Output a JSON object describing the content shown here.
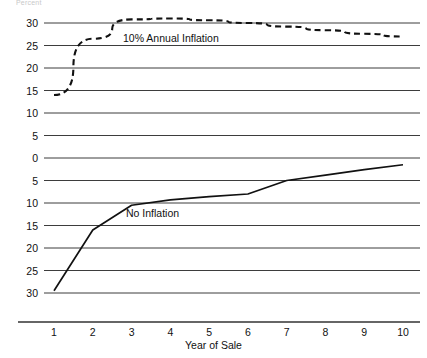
{
  "top_fragment": "Percent",
  "chart_data": {
    "type": "line",
    "title": "",
    "xlabel": "Year of Sale",
    "ylabel": "",
    "x": [
      1,
      2,
      3,
      4,
      5,
      6,
      7,
      8,
      9,
      10
    ],
    "xtick_labels": [
      "1",
      "2",
      "3",
      "4",
      "5",
      "6",
      "7",
      "8",
      "9",
      "10"
    ],
    "ytick_values": [
      30,
      25,
      20,
      15,
      10,
      5,
      0,
      -5,
      -10,
      -15,
      -20,
      -25,
      -30
    ],
    "ytick_labels": [
      "30",
      "25",
      "20",
      "15",
      "10",
      "5",
      "0",
      "5",
      "10",
      "15",
      "20",
      "25",
      "30"
    ],
    "ylim": [
      -30,
      30
    ],
    "xlim": [
      1,
      10
    ],
    "grid": true,
    "legend_position": "inline-annotations",
    "series": [
      {
        "name": "10% Annual Inflation",
        "style": "dashed",
        "color": "#111111",
        "values": [
          14,
          26.5,
          30.8,
          31,
          30.6,
          30,
          29.2,
          28.4,
          27.6,
          27
        ]
      },
      {
        "name": "No Inflation",
        "style": "solid",
        "color": "#111111",
        "values": [
          -29.5,
          -16,
          -10.5,
          -9.3,
          -8.6,
          -8,
          -5,
          -3.8,
          -2.6,
          -1.5
        ]
      }
    ],
    "annotations": [
      {
        "text": "10% Annual Inflation",
        "x": 3.8,
        "y": 26.5
      },
      {
        "text": "No Inflation",
        "x": 3.9,
        "y": -12.5
      }
    ]
  }
}
